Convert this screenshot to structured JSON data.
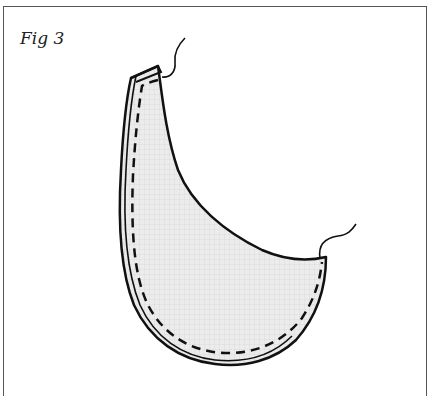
{
  "figure": {
    "label": "Fig 3",
    "colors": {
      "outline": "#111111",
      "fill": "#ebebeb",
      "grid": "#cfcfcf",
      "border": "#555555",
      "background": "#ffffff"
    },
    "elements": [
      "outer-fabric-outline",
      "layered-edge",
      "dashed-stitch-line",
      "thread-tail-top",
      "thread-tail-right"
    ]
  }
}
